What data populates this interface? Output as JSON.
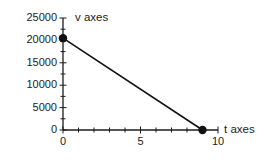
{
  "colors": {
    "background": "#ffffff",
    "axis": "#1c1c1c",
    "text": "#1c1c1c",
    "series": "#111111"
  },
  "chart_data": {
    "type": "line",
    "title": "",
    "xlabel": "t axes",
    "ylabel": "v axes",
    "xlim": [
      0,
      10
    ],
    "ylim": [
      0,
      25000
    ],
    "x_major_ticks": [
      0,
      5,
      10
    ],
    "x_tick_labels": [
      "0",
      "5",
      "10"
    ],
    "x_minor_step": 1,
    "y_major_ticks": [
      0,
      5000,
      10000,
      15000,
      20000,
      25000
    ],
    "y_tick_labels": [
      "0",
      "5000",
      "10000",
      "15000",
      "20000",
      "25000"
    ],
    "y_minor_step": 2500,
    "grid": false,
    "legend": false,
    "series": [
      {
        "name": "v vs t",
        "x": [
          0,
          9
        ],
        "y": [
          20500,
          0
        ],
        "marker": "filled-circle",
        "color": "#111111"
      }
    ]
  }
}
